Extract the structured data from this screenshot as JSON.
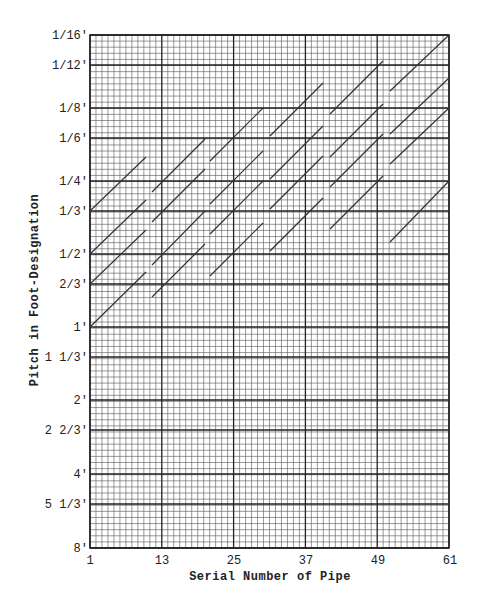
{
  "chart_data": {
    "type": "line",
    "title": "",
    "header_text_cut_off": true,
    "xlabel": "Serial Number of Pipe",
    "ylabel": "Pitch in Foot-Designation",
    "x_ticks": [
      1,
      13,
      25,
      37,
      49,
      61
    ],
    "xlim": [
      1,
      61
    ],
    "y_scale": "log2 (inverted: shorter pitch at top)",
    "y_ticks": [
      "1/16'",
      "1/12'",
      "1/8'",
      "1/6'",
      "1/4'",
      "1/3'",
      "1/2'",
      "2/3'",
      "1'",
      "1 1/3'",
      "2'",
      "2 2/3'",
      "4'",
      "5 1/3'",
      "8'"
    ],
    "y_tick_values_ft": [
      0.0625,
      0.08333,
      0.125,
      0.16667,
      0.25,
      0.33333,
      0.5,
      0.66667,
      1,
      1.33333,
      2,
      2.66667,
      4,
      5.33333,
      8
    ],
    "ylim_ft": [
      8,
      0.0625
    ],
    "grid": {
      "minor_x_step": 1,
      "major_x_step": 12,
      "minor_y_per_octave": 12,
      "on": true
    },
    "legend": null,
    "series_note": "Each segment is a rank of pipes rising one octave per 12 pipes (breaking back at the groups).",
    "segments": [
      {
        "group": 1,
        "x": [
          1,
          10.3
        ],
        "y_ft": [
          0.3333,
          0.2
        ]
      },
      {
        "group": 1,
        "x": [
          1,
          10.3
        ],
        "y_ft": [
          0.5,
          0.3
        ]
      },
      {
        "group": 1,
        "x": [
          1,
          10.3
        ],
        "y_ft": [
          0.6667,
          0.4
        ]
      },
      {
        "group": 1,
        "x": [
          1,
          10.3
        ],
        "y_ft": [
          1,
          0.593
        ]
      },
      {
        "group": 2,
        "x": [
          11.3,
          20.2
        ],
        "y_ft": [
          0.4219,
          0.2547
        ]
      },
      {
        "group": 2,
        "x": [
          11.3,
          20.2
        ],
        "y_ft": [
          0.5625,
          0.3395
        ]
      },
      {
        "group": 2,
        "x": [
          11.3,
          20.2
        ],
        "y_ft": [
          0.8434,
          0.5092
        ]
      },
      {
        "group": 2,
        "x": [
          11.3,
          20.2
        ],
        "y_ft": [
          1.1445,
          0.6966
        ]
      },
      {
        "group": 3,
        "x": [
          21,
          29.8
        ],
        "y_ft": [
          0.2067,
          0.1262
        ]
      },
      {
        "group": 3,
        "x": [
          21,
          29.8
        ],
        "y_ft": [
          0.312,
          0.1893
        ]
      },
      {
        "group": 3,
        "x": [
          21,
          29.8
        ],
        "y_ft": [
          0.416,
          0.2524
        ]
      },
      {
        "group": 3,
        "x": [
          21,
          29.8
        ],
        "y_ft": [
          0.6241,
          0.3786
        ]
      },
      {
        "group": 4,
        "x": [
          31,
          39.8
        ],
        "y_ft": [
          0.1631,
          0.099
        ]
      },
      {
        "group": 4,
        "x": [
          31,
          39.8
        ],
        "y_ft": [
          0.246,
          0.1493
        ]
      },
      {
        "group": 4,
        "x": [
          31,
          39.8
        ],
        "y_ft": [
          0.328,
          0.1991
        ]
      },
      {
        "group": 4,
        "x": [
          31,
          39.8
        ],
        "y_ft": [
          0.492,
          0.2986
        ]
      },
      {
        "group": 5,
        "x": [
          41,
          49.8
        ],
        "y_ft": [
          0.132,
          0.0803
        ]
      },
      {
        "group": 5,
        "x": [
          41,
          49.8
        ],
        "y_ft": [
          0.1991,
          0.1208
        ]
      },
      {
        "group": 5,
        "x": [
          41,
          49.8
        ],
        "y_ft": [
          0.2655,
          0.1611
        ]
      },
      {
        "group": 5,
        "x": [
          41,
          49.8
        ],
        "y_ft": [
          0.3982,
          0.2416
        ]
      },
      {
        "group": 6,
        "x": [
          51,
          61
        ],
        "y_ft": [
          0.1062,
          0.0625
        ]
      },
      {
        "group": 6,
        "x": [
          51,
          61
        ],
        "y_ft": [
          0.1602,
          0.0942
        ]
      },
      {
        "group": 6,
        "x": [
          51,
          61
        ],
        "y_ft": [
          0.2136,
          0.1254
        ]
      },
      {
        "group": 6,
        "x": [
          51,
          61
        ],
        "y_ft": [
          0.45,
          0.25
        ]
      }
    ]
  },
  "layout_px": {
    "plot_left": 90,
    "plot_right": 449,
    "plot_top": 35,
    "plot_bottom": 548,
    "y_one_foot_px": 327,
    "octave_px": 73,
    "px_per_pipe": 6,
    "y_tick_px": [
      35,
      65,
      108,
      138,
      181,
      211,
      254,
      284,
      327,
      357,
      400,
      430,
      474,
      504,
      548
    ],
    "segments_px": [
      [
        90,
        211,
        146,
        157
      ],
      [
        90,
        254,
        146,
        200
      ],
      [
        90,
        284,
        146,
        230
      ],
      [
        90,
        327,
        146,
        272
      ],
      [
        152,
        192,
        205,
        139
      ],
      [
        152,
        222,
        205,
        169
      ],
      [
        152,
        265,
        205,
        211
      ],
      [
        152,
        297,
        205,
        244
      ],
      [
        210,
        161,
        263,
        108
      ],
      [
        210,
        204,
        263,
        151
      ],
      [
        210,
        234,
        263,
        181
      ],
      [
        210,
        276,
        263,
        223
      ],
      [
        270,
        136,
        323,
        83
      ],
      [
        270,
        179,
        323,
        126
      ],
      [
        270,
        209,
        323,
        156
      ],
      [
        270,
        251,
        323,
        198
      ],
      [
        330,
        114,
        383,
        61
      ],
      [
        330,
        157,
        383,
        104
      ],
      [
        330,
        187,
        383,
        134
      ],
      [
        330,
        229,
        383,
        176
      ],
      [
        390,
        91,
        449,
        35
      ],
      [
        390,
        134,
        449,
        78
      ],
      [
        390,
        164,
        449,
        108
      ],
      [
        390,
        242,
        449,
        181
      ]
    ]
  },
  "colors": {
    "background": "#ffffff",
    "grid_minor": "#555555",
    "grid_major": "#222222",
    "segment": "#333333",
    "text": "#222222"
  }
}
